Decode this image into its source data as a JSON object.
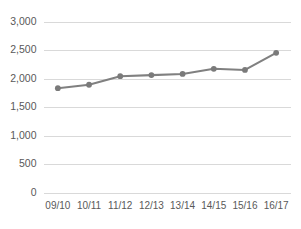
{
  "chart_data": {
    "type": "line",
    "title": "",
    "subtitle": "",
    "xlabel": "",
    "ylabel": "",
    "categories": [
      "09/10",
      "10/11",
      "11/12",
      "12/13",
      "13/14",
      "14/15",
      "15/16",
      "16/17"
    ],
    "values": [
      1830,
      1890,
      2040,
      2060,
      2080,
      2170,
      2150,
      2450
    ],
    "series": [
      {
        "name": "",
        "values": [
          1830,
          1890,
          2040,
          2060,
          2080,
          2170,
          2150,
          2450
        ]
      }
    ],
    "ylim": [
      0,
      3000
    ],
    "ytick_values": [
      0,
      500,
      1000,
      1500,
      2000,
      2500,
      3000
    ],
    "ytick_labels": [
      "0",
      "500",
      "1,000",
      "1,500",
      "2,000",
      "2,500",
      "3,000"
    ],
    "xtick_labels": [
      "09/10",
      "10/11",
      "11/12",
      "12/13",
      "13/14",
      "14/15",
      "15/16",
      "16/17"
    ],
    "grid": true,
    "grid_axis": "y",
    "legend": false,
    "legend_position": "none",
    "markers": true,
    "annotations": [],
    "colors": {
      "line": "#808080",
      "marker": "#7a7a7a",
      "gridline": "#d9d9d9",
      "tick_label": "#595959",
      "background": "#ffffff"
    }
  }
}
